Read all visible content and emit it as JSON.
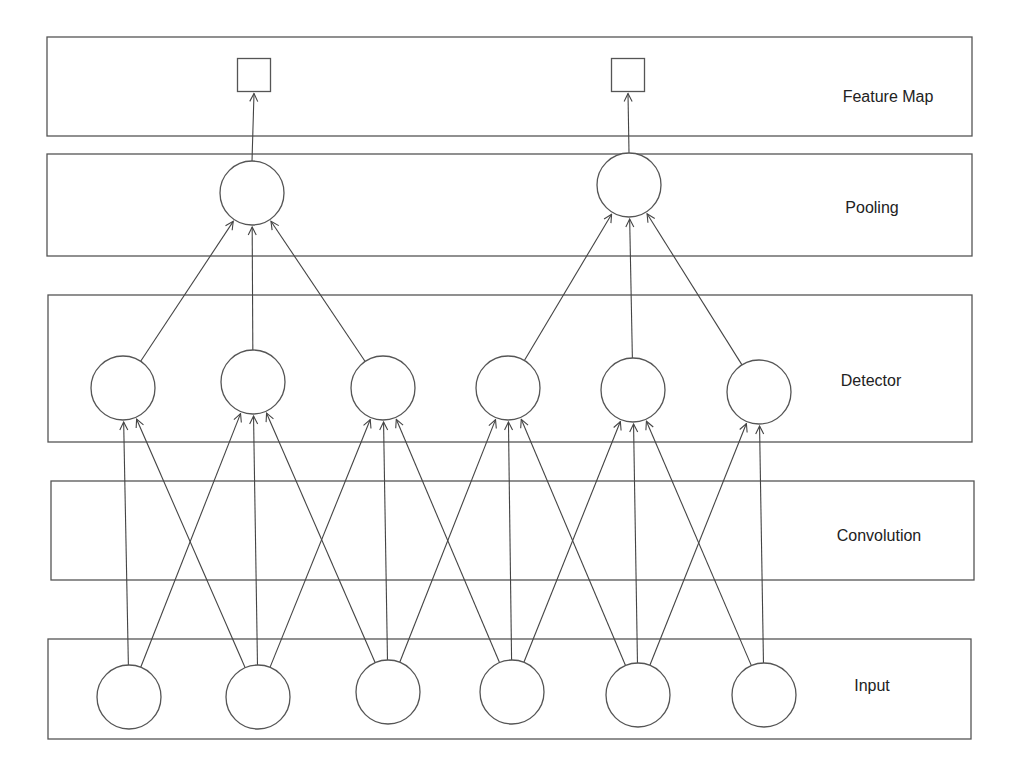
{
  "diagram": {
    "layers": [
      {
        "id": "feature_map",
        "label": "Feature Map",
        "node_shape": "square",
        "nodes": 2
      },
      {
        "id": "pooling",
        "label": "Pooling",
        "node_shape": "circle",
        "nodes": 2
      },
      {
        "id": "detector",
        "label": "Detector",
        "node_shape": "circle",
        "nodes": 6
      },
      {
        "id": "convolution",
        "label": "Convolution",
        "node_shape": "none",
        "nodes": 0
      },
      {
        "id": "input",
        "label": "Input",
        "node_shape": "circle",
        "nodes": 6
      }
    ],
    "edges": {
      "input_to_detector": [
        [
          0,
          0
        ],
        [
          0,
          1
        ],
        [
          1,
          0
        ],
        [
          1,
          1
        ],
        [
          1,
          2
        ],
        [
          2,
          1
        ],
        [
          2,
          2
        ],
        [
          2,
          3
        ],
        [
          3,
          2
        ],
        [
          3,
          3
        ],
        [
          3,
          4
        ],
        [
          4,
          3
        ],
        [
          4,
          4
        ],
        [
          4,
          5
        ],
        [
          5,
          4
        ],
        [
          5,
          5
        ]
      ],
      "detector_to_pooling": [
        [
          0,
          0
        ],
        [
          1,
          0
        ],
        [
          2,
          0
        ],
        [
          3,
          1
        ],
        [
          4,
          1
        ],
        [
          5,
          1
        ]
      ],
      "pooling_to_feature_map": [
        [
          0,
          0
        ],
        [
          1,
          1
        ]
      ]
    }
  }
}
